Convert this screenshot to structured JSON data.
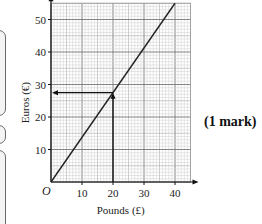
{
  "chart_data": {
    "type": "line",
    "title": "",
    "xlabel": "Pounds (£)",
    "ylabel": "Euros (€)",
    "xlim": [
      0,
      45
    ],
    "ylim": [
      0,
      55
    ],
    "x_ticks": [
      10,
      20,
      30,
      40
    ],
    "y_ticks": [
      10,
      20,
      30,
      40,
      50
    ],
    "origin_label": "O",
    "grid": true,
    "series": [
      {
        "name": "conversion",
        "x": [
          0,
          40
        ],
        "y": [
          0,
          55
        ]
      }
    ],
    "annotations": [
      {
        "type": "arrow-vertical",
        "x": 20,
        "from_y": 0,
        "to_y": 27.5
      },
      {
        "type": "arrow-horizontal",
        "y": 27.5,
        "from_x": 20,
        "to_x": 0
      }
    ]
  },
  "side_boxes": 3,
  "mark_label": "(1 mark)"
}
